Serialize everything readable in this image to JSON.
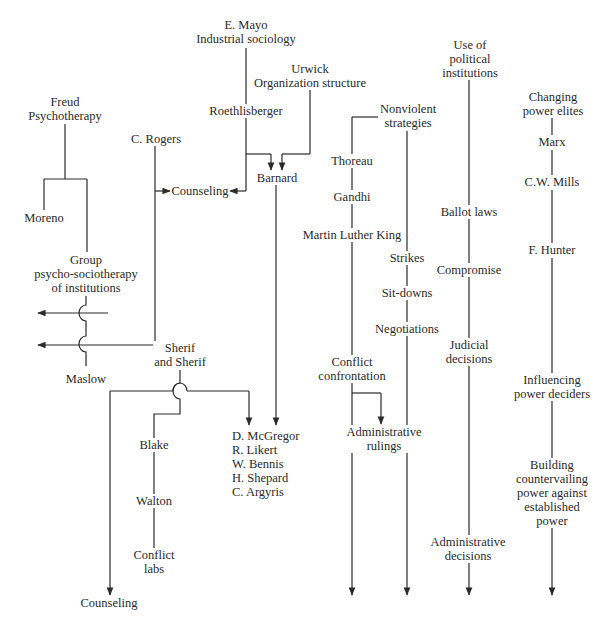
{
  "diagram": {
    "title": "",
    "arrow_color": "#2a2a2a",
    "nodes": {
      "mayo": [
        "E. Mayo",
        "Industrial sociology"
      ],
      "urwick": [
        "Urwick",
        "Organization structure"
      ],
      "freud": [
        "Freud",
        "Psychotherapy"
      ],
      "roethlisberger": [
        "Roethlisberger"
      ],
      "rogers": [
        "C. Rogers"
      ],
      "counseling_top": [
        "Counseling"
      ],
      "barnard": [
        "Barnard"
      ],
      "moreno": [
        "Moreno"
      ],
      "group": [
        "Group",
        "psycho-sociotherapy",
        "of institutions"
      ],
      "maslow": [
        "Maslow"
      ],
      "sherif": [
        "Sherif",
        "and Sherif"
      ],
      "blake": [
        "Blake"
      ],
      "walton": [
        "Walton"
      ],
      "conflict_labs": [
        "Conflict",
        "labs"
      ],
      "counseling_bottom": [
        "Counseling"
      ],
      "od_group": [
        "D. McGregor",
        "R. Likert",
        "W. Bennis",
        "H. Shepard",
        "C. Argyris"
      ],
      "nonviolent": [
        "Nonviolent",
        "strategies"
      ],
      "thoreau": [
        "Thoreau"
      ],
      "gandhi": [
        "Gandhi"
      ],
      "mlk": [
        "Martin Luther King"
      ],
      "strikes": [
        "Strikes"
      ],
      "sitdowns": [
        "Sit-downs"
      ],
      "negotiations": [
        "Negotiations"
      ],
      "conflict_confrontation": [
        "Conflict",
        "confrontation"
      ],
      "admin_rulings": [
        "Administrative",
        "rulings"
      ],
      "political": [
        "Use of",
        "political",
        "institutions"
      ],
      "ballot": [
        "Ballot laws"
      ],
      "compromise": [
        "Compromise"
      ],
      "judicial": [
        "Judicial",
        "decisions"
      ],
      "admin_decisions": [
        "Administrative",
        "decisions"
      ],
      "power_elites": [
        "Changing",
        "power elites"
      ],
      "marx": [
        "Marx"
      ],
      "mills": [
        "C.W. Mills"
      ],
      "hunter": [
        "F. Hunter"
      ],
      "influencing": [
        "Influencing",
        "power deciders"
      ],
      "countervailing": [
        "Building",
        "countervailing",
        "power against",
        "established",
        "power"
      ]
    }
  }
}
